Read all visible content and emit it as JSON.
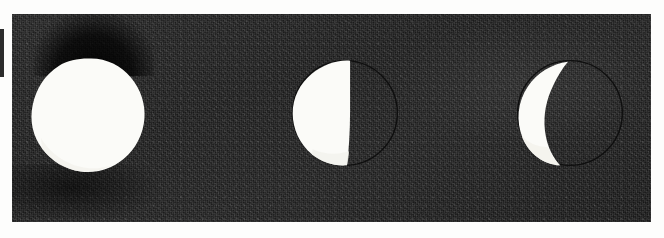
{
  "image": {
    "title": "Moon phases photographic plate",
    "subject": "three-moon-phase-sequence",
    "width_px": 664,
    "height_px": 238,
    "medium": "halftone photographic print on textured dark card"
  },
  "colors": {
    "page_background": "#fdfdfc",
    "plate_background": "#1d1d1d",
    "plate_background_light": "#242424",
    "lit_surface": "#fbfbf8",
    "lit_surface_shadow": "#f3f2ec",
    "disc_outline": "#0b0b0b",
    "edge_fragment": "#1a1a1a"
  },
  "plate": {
    "left": 12,
    "top": 14,
    "width": 639,
    "height": 208
  },
  "moons": [
    {
      "name": "full-moon",
      "label": "Full moon",
      "phase": "full",
      "illuminated_fraction": 1.0,
      "center_x": 88,
      "center_y": 115,
      "radius": 54,
      "outline_visible": false,
      "terminator": "none"
    },
    {
      "name": "half-moon",
      "label": "Last quarter (half) moon",
      "phase": "half",
      "illuminated_fraction": 0.5,
      "center_x": 345,
      "center_y": 113,
      "radius": 52,
      "outline_visible": true,
      "terminator": "straight-vertical",
      "lit_side": "left"
    },
    {
      "name": "crescent-moon",
      "label": "Waning crescent moon",
      "phase": "crescent",
      "illuminated_fraction": 0.18,
      "center_x": 570,
      "center_y": 113,
      "radius": 52,
      "outline_visible": true,
      "terminator": "curved",
      "lit_side": "left"
    }
  ],
  "artifacts": [
    {
      "name": "edge-fragment",
      "description": "thin dark sliver at the far-left margin"
    },
    {
      "name": "smudge-top-left",
      "description": "dark shading above the full moon disc"
    },
    {
      "name": "smudge-bottom-left",
      "description": "dark shading below-left of the full moon disc"
    },
    {
      "name": "highlight-band",
      "description": "faint lighter band across the upper-middle of the plate"
    }
  ]
}
